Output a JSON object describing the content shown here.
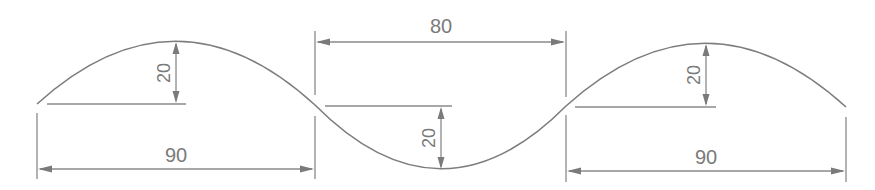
{
  "diagram": {
    "type": "technical-drawing",
    "colors": {
      "line": "#7d7d7d",
      "dimension": "#8a8a8a",
      "text": "#7a7a7a",
      "background": "#ffffff"
    },
    "dimensions": {
      "left_span": {
        "label": "90",
        "value": 90
      },
      "left_height": {
        "label": "20",
        "value": 20
      },
      "middle_span": {
        "label": "80",
        "value": 80
      },
      "middle_depth": {
        "label": "20",
        "value": 20
      },
      "right_span": {
        "label": "90",
        "value": 90
      },
      "right_height": {
        "label": "20",
        "value": 20
      }
    }
  }
}
